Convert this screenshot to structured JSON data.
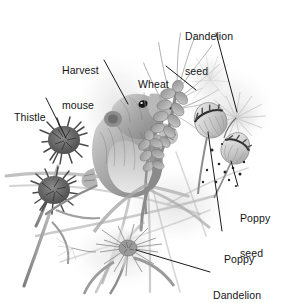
{
  "figure": {
    "style": "grayscale pencil illustration",
    "background_color": "#ffffff",
    "text_color": "#141414",
    "leader_line_color": "#1a1a1a"
  },
  "labels": [
    {
      "id": "dandelion-seed",
      "line1": "Dandelion",
      "line2": "seed",
      "x": 185,
      "y": 8,
      "leader": {
        "x1": 216,
        "y1": 33,
        "x2": 237,
        "y2": 112
      }
    },
    {
      "id": "harvest-mouse",
      "line1": "Harvest",
      "line2": "mouse",
      "x": 62,
      "y": 42,
      "leader": {
        "x1": 104,
        "y1": 60,
        "x2": 128,
        "y2": 104
      }
    },
    {
      "id": "wheat",
      "line1": "Wheat",
      "line2": "",
      "x": 138,
      "y": 56,
      "leader": {
        "x1": 166,
        "y1": 66,
        "x2": 196,
        "y2": 90
      }
    },
    {
      "id": "thistle",
      "line1": "Thistle",
      "line2": "",
      "x": 14,
      "y": 89,
      "leader": {
        "x1": 46,
        "y1": 98,
        "x2": 66,
        "y2": 138
      }
    },
    {
      "id": "poppy-seed",
      "line1": "Poppy",
      "line2": "seed",
      "x": 240,
      "y": 190,
      "leader": {
        "x1": 238,
        "y1": 186,
        "x2": 231,
        "y2": 161
      }
    },
    {
      "id": "poppy",
      "line1": "Poppy",
      "line2": "",
      "x": 224,
      "y": 231,
      "leader": {
        "x1": 222,
        "y1": 231,
        "x2": 208,
        "y2": 132
      }
    },
    {
      "id": "dandelion",
      "line1": "Dandelion",
      "line2": "",
      "x": 213,
      "y": 267,
      "leader": {
        "x1": 210,
        "y1": 272,
        "x2": 136,
        "y2": 250
      }
    }
  ],
  "subjects": [
    {
      "name": "harvest-mouse",
      "description": "harvest mouse climbing wheat stalk"
    },
    {
      "name": "wheat-ear",
      "description": "wheat ears with awns"
    },
    {
      "name": "thistle-upper",
      "description": "upper thistle flower head"
    },
    {
      "name": "thistle-lower",
      "description": "lower thistle flower head"
    },
    {
      "name": "poppy-pod-upper",
      "description": "upper poppy seed pod"
    },
    {
      "name": "poppy-pod-lower",
      "description": "lower poppy seed pod"
    },
    {
      "name": "poppy-seeds",
      "description": "scattered poppy seeds"
    },
    {
      "name": "dandelion-clock",
      "description": "dandelion seedhead at lower centre"
    },
    {
      "name": "dandelion-pappus",
      "description": "floating dandelion seed with pappus"
    }
  ]
}
